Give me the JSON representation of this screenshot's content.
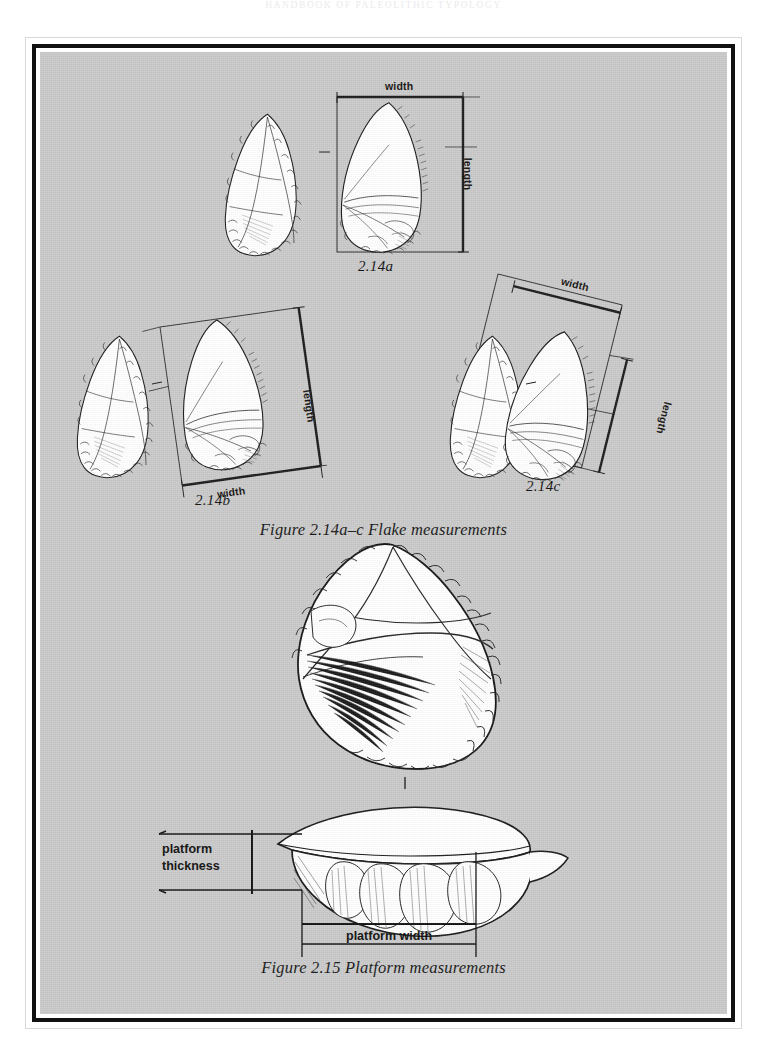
{
  "page": {
    "running_head": "HANDBOOK OF PALEOLITHIC TYPOLOGY",
    "background_color": "#c9c9c9",
    "frame_color": "#111111"
  },
  "figures": [
    {
      "id": "figure-2-14",
      "caption": "Figure 2.14a–c  Flake measurements",
      "panels": [
        {
          "id": "2.14a",
          "label": "2.14a",
          "measurement_labels": [
            "width",
            "length"
          ],
          "frame_style": "upright-rectangle",
          "description": "Flake shown in dorsal and ventral view with an upright bounding box; width measured across the top, length measured down the right side."
        },
        {
          "id": "2.14b",
          "label": "2.14b",
          "measurement_labels": [
            "width",
            "length"
          ],
          "frame_style": "rotated-rectangle",
          "description": "Flake with measurement frame rotated to align with the flake's axis of percussion; width along the bottom, length along the right."
        },
        {
          "id": "2.14c",
          "label": "2.14c",
          "measurement_labels": [
            "width",
            "length"
          ],
          "frame_style": "rotated-rectangle",
          "description": "Flake with an obliquely rotated measurement frame; width along the upper edge, length along the right edge."
        }
      ]
    },
    {
      "id": "figure-2-15",
      "caption": "Figure 2.15  Platform measurements",
      "measurement_labels": [
        "platform thickness",
        "platform width"
      ],
      "description": "Large flake drawn in plan view above a proximal-end view; brackets indicate platform thickness at the left and platform width below."
    }
  ],
  "labels": {
    "width": "width",
    "length": "length",
    "platform_thickness_line1": "platform",
    "platform_thickness_line2": "thickness",
    "platform_width": "platform width"
  }
}
